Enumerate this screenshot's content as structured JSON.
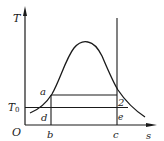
{
  "diagram": {
    "type": "T-s diagram",
    "axes": {
      "y_label": "T",
      "x_label": "s",
      "origin_label": "O"
    },
    "reference_temperature": {
      "label": "T",
      "subscript": "0"
    },
    "points": {
      "a": "a",
      "d": "d",
      "b": "b",
      "c": "c",
      "two": "2",
      "e": "e"
    },
    "colors": {
      "line": "#1a1a1a",
      "background": "#ffffff"
    }
  }
}
